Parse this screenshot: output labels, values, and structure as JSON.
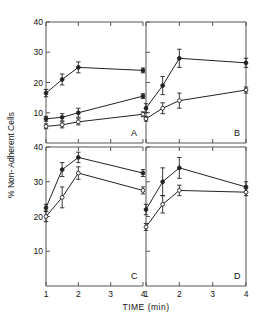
{
  "figure": {
    "ylabel": "% Non- Adherent Cells",
    "xlabel": "TIME (min)",
    "xticklabels": [
      "1",
      "2",
      "3",
      "4"
    ],
    "ytick_top": [
      "10",
      "20",
      "30",
      "40"
    ],
    "ytick_bottom": [
      "10",
      "20",
      "30",
      "40"
    ],
    "panel_labels": [
      "A",
      "B",
      "C",
      "D"
    ],
    "line_color": "#222222",
    "axis_color": "#555555"
  },
  "chart_data": [
    {
      "type": "line",
      "title": "A",
      "xlabel": "TIME (min)",
      "ylabel": "% Non- Adherent Cells",
      "xlim": [
        1,
        4
      ],
      "ylim": [
        0,
        40
      ],
      "xticks": [
        1,
        2,
        3,
        4
      ],
      "yticks": [
        10,
        20,
        30,
        40
      ],
      "grid": false,
      "legend": "none",
      "x": [
        1,
        1.5,
        2,
        4
      ],
      "series": [
        {
          "name": "upper",
          "marker": "filled-circle",
          "values": [
            16.5,
            21.0,
            25.0,
            24.0
          ],
          "errors": [
            1.2,
            1.8,
            1.8,
            0.8
          ]
        },
        {
          "name": "middle",
          "marker": "filled-circle",
          "values": [
            8.0,
            8.5,
            10.0,
            15.5
          ],
          "errors": [
            0.8,
            1.2,
            1.5,
            0.8
          ]
        },
        {
          "name": "lower",
          "marker": "open-circle",
          "values": [
            5.5,
            6.0,
            7.0,
            9.5
          ],
          "errors": [
            0.8,
            1.0,
            1.0,
            0.8
          ]
        }
      ]
    },
    {
      "type": "line",
      "title": "B",
      "xlabel": "TIME (min)",
      "ylabel": "% Non- Adherent Cells",
      "xlim": [
        1,
        4
      ],
      "ylim": [
        0,
        40
      ],
      "xticks": [
        1,
        2,
        3,
        4
      ],
      "yticks": [
        10,
        20,
        30,
        40
      ],
      "grid": false,
      "legend": "none",
      "x": [
        1,
        1.5,
        2,
        4
      ],
      "series": [
        {
          "name": "upper",
          "marker": "filled-circle",
          "values": [
            11.5,
            19.0,
            28.0,
            26.5
          ],
          "errors": [
            1.5,
            3.0,
            3.0,
            1.5
          ]
        },
        {
          "name": "lower",
          "marker": "open-circle",
          "values": [
            8.0,
            11.5,
            14.0,
            17.5
          ],
          "errors": [
            0.8,
            1.8,
            2.5,
            1.0
          ]
        }
      ]
    },
    {
      "type": "line",
      "title": "C",
      "xlabel": "TIME (min)",
      "ylabel": "% Non- Adherent Cells",
      "xlim": [
        1,
        4
      ],
      "ylim": [
        0,
        40
      ],
      "xticks": [
        1,
        2,
        3,
        4
      ],
      "yticks": [
        10,
        20,
        30,
        40
      ],
      "grid": false,
      "legend": "none",
      "x": [
        1,
        1.5,
        2,
        4
      ],
      "series": [
        {
          "name": "upper",
          "marker": "filled-circle",
          "values": [
            22.5,
            33.5,
            37.0,
            32.5
          ],
          "errors": [
            1.0,
            2.0,
            1.5,
            1.0
          ]
        },
        {
          "name": "lower",
          "marker": "open-circle",
          "values": [
            20.0,
            25.5,
            32.5,
            27.5
          ],
          "errors": [
            1.5,
            3.0,
            1.8,
            1.0
          ]
        }
      ]
    },
    {
      "type": "line",
      "title": "D",
      "xlabel": "TIME (min)",
      "ylabel": "% Non- Adherent Cells",
      "xlim": [
        1,
        4
      ],
      "ylim": [
        0,
        40
      ],
      "xticks": [
        1,
        2,
        3,
        4
      ],
      "yticks": [
        10,
        20,
        30,
        40
      ],
      "grid": false,
      "legend": "none",
      "x": [
        1,
        1.5,
        2,
        4
      ],
      "series": [
        {
          "name": "upper",
          "marker": "filled-circle",
          "values": [
            22.0,
            30.0,
            34.0,
            28.5
          ],
          "errors": [
            1.5,
            4.0,
            3.0,
            1.5
          ]
        },
        {
          "name": "lower",
          "marker": "open-circle",
          "values": [
            17.0,
            23.5,
            27.5,
            27.0
          ],
          "errors": [
            1.0,
            2.5,
            1.5,
            1.0
          ]
        }
      ]
    }
  ]
}
